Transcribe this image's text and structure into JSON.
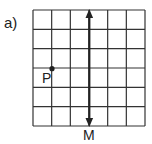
{
  "figure": {
    "part_label": "a)",
    "grid": {
      "cols": 6,
      "rows": 6,
      "x0": 33,
      "y0": 10,
      "x1": 145,
      "y1": 126,
      "line_color": "#333333"
    },
    "point": {
      "label": "P",
      "col": 1,
      "row": 3
    },
    "line": {
      "label": "M",
      "col": 3,
      "type": "double-arrow vertical"
    }
  }
}
